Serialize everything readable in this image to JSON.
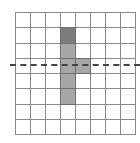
{
  "diagram": {
    "grid": {
      "rows": 8,
      "cols": 8,
      "origin": [
        15,
        12
      ],
      "cell_w": 15,
      "cell_h": 15.25,
      "line_color": "#8a8a8a"
    },
    "shaded_cells": [
      {
        "col": 3,
        "row": 1,
        "color": "#7c7c7c"
      },
      {
        "col": 3,
        "row": 2,
        "color": "#a6a6a6"
      },
      {
        "col": 3,
        "row": 3,
        "color": "#a6a6a6"
      },
      {
        "col": 4,
        "row": 3,
        "color": "#a6a6a6"
      },
      {
        "col": 3,
        "row": 4,
        "color": "#a6a6a6"
      },
      {
        "col": 3,
        "row": 5,
        "color": "#a6a6a6"
      }
    ],
    "dashed_line": {
      "orientation": "horizontal",
      "y": 65,
      "color": "#444444"
    }
  }
}
